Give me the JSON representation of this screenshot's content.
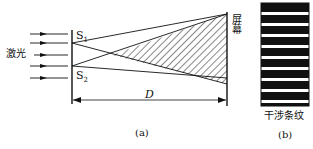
{
  "diagram": {
    "part_a": {
      "caption": "(a)",
      "source_label": "激光",
      "slit1_label": "S",
      "slit1_sub": "1",
      "slit2_label": "S",
      "slit2_sub": "2",
      "screen_label": "屏幕",
      "distance_label": "D",
      "incident_rays": 5
    },
    "part_b": {
      "caption": "(b)",
      "pattern_label": "干涉条纹",
      "fringe_count_dark": 9,
      "fringe_count_bright": 8
    },
    "colors": {
      "ink": "#111111",
      "background": "#ffffff"
    }
  }
}
